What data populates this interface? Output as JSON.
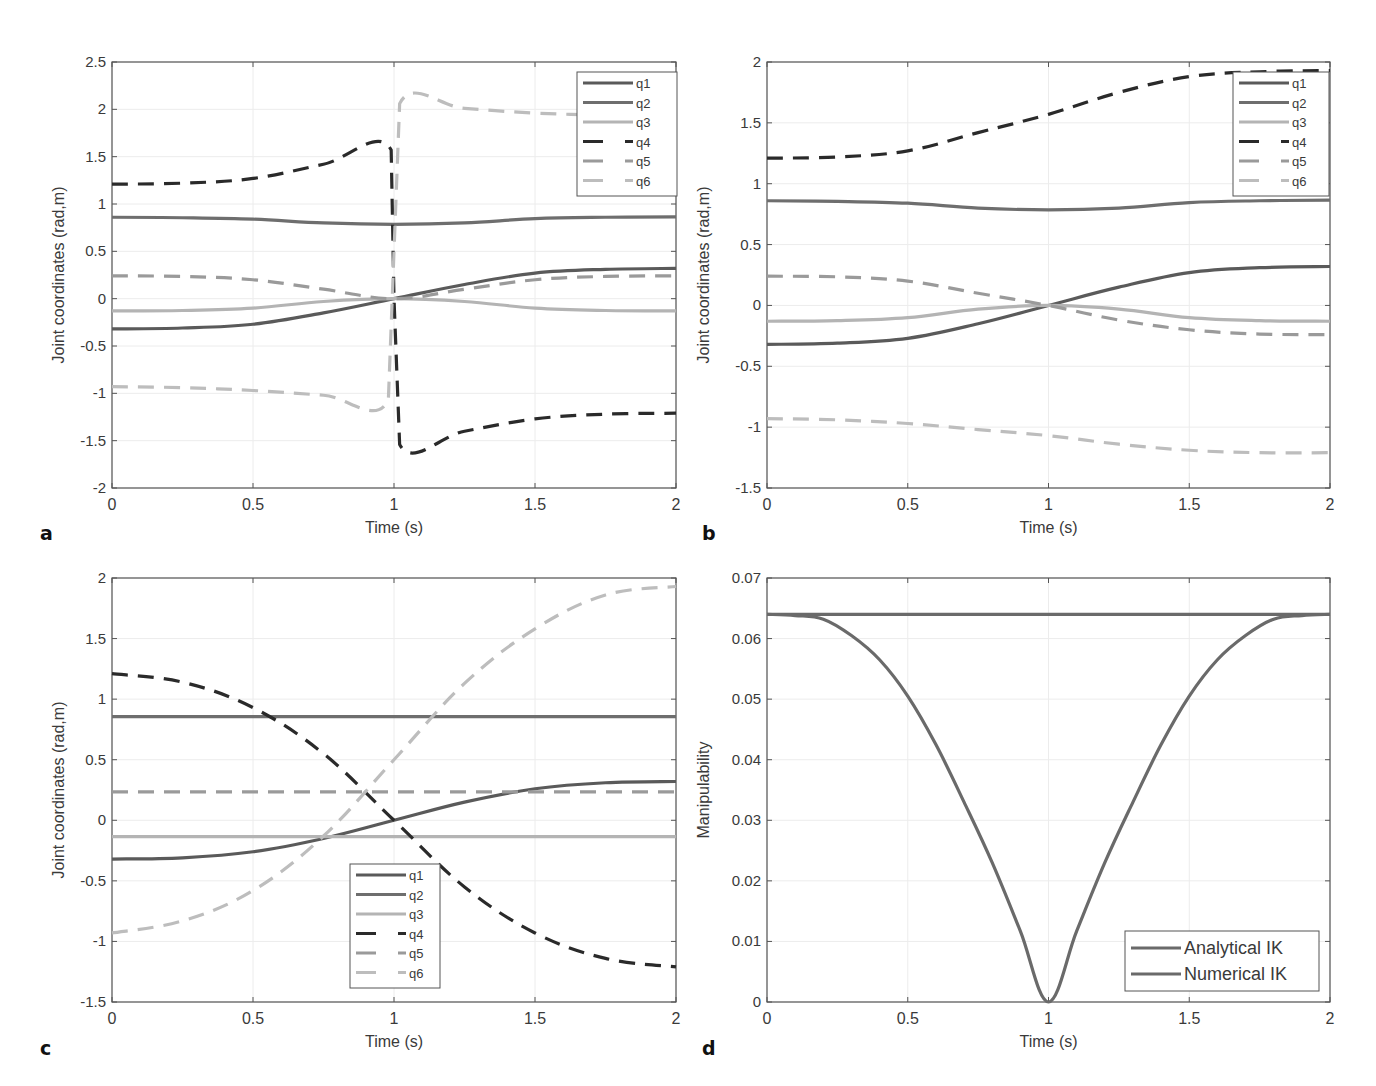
{
  "figure": {
    "panel_letters": [
      "a",
      "b",
      "c",
      "d"
    ]
  },
  "colors": {
    "q1": "#5a5a5a",
    "q2": "#6e6e6e",
    "q3": "#b4b4b4",
    "q4": "#2a2a2a",
    "q5": "#9a9a9a",
    "q6": "#bdbdbd",
    "analytical": "#6a6a6a",
    "numerical": "#6a6a6a",
    "axis": "#555555",
    "grid": "#ececec"
  },
  "chart_data": [
    {
      "id": "a",
      "type": "line",
      "title": "",
      "xlabel": "Time (s)",
      "ylabel": "Joint coordinates (rad,m)",
      "xlim": [
        0,
        2
      ],
      "ylim": [
        -2,
        2.5
      ],
      "xticks": [
        0,
        0.5,
        1,
        1.5,
        2
      ],
      "xtick_labels": [
        "0",
        "0.5",
        "1",
        "1.5",
        "2"
      ],
      "yticks": [
        -2,
        -1.5,
        -1,
        -0.5,
        0,
        0.5,
        1,
        1.5,
        2,
        2.5
      ],
      "ytick_labels": [
        "-2",
        "-1.5",
        "-1",
        "-0.5",
        "0",
        "0.5",
        "1",
        "1.5",
        "2",
        "2.5"
      ],
      "grid": true,
      "legend_position": "northeast",
      "legend": [
        "q1",
        "q2",
        "q3",
        "q4",
        "q5",
        "q6"
      ],
      "series": [
        {
          "name": "q1",
          "style": "solid",
          "x": [
            0,
            0.25,
            0.5,
            0.75,
            1.0,
            1.25,
            1.5,
            1.75,
            2.0
          ],
          "values": [
            -0.32,
            -0.31,
            -0.27,
            -0.15,
            0.0,
            0.15,
            0.27,
            0.31,
            0.32
          ]
        },
        {
          "name": "q2",
          "style": "solid",
          "x": [
            0,
            0.25,
            0.5,
            0.75,
            1.0,
            1.25,
            1.5,
            1.75,
            2.0
          ],
          "values": [
            0.86,
            0.855,
            0.84,
            0.8,
            0.785,
            0.8,
            0.845,
            0.86,
            0.865
          ]
        },
        {
          "name": "q3",
          "style": "solid",
          "x": [
            0,
            0.25,
            0.5,
            0.75,
            1.0,
            1.25,
            1.5,
            1.75,
            2.0
          ],
          "values": [
            -0.13,
            -0.125,
            -0.1,
            -0.03,
            0.0,
            -0.03,
            -0.1,
            -0.125,
            -0.13
          ]
        },
        {
          "name": "q4",
          "style": "dashed",
          "x": [
            0,
            0.25,
            0.5,
            0.75,
            0.99,
            1.0,
            1.02,
            1.25,
            1.5,
            1.75,
            2.0
          ],
          "values": [
            1.21,
            1.22,
            1.27,
            1.42,
            1.57,
            0.0,
            -1.54,
            -1.4,
            -1.27,
            -1.22,
            -1.21
          ]
        },
        {
          "name": "q5",
          "style": "dashed",
          "x": [
            0,
            0.25,
            0.5,
            0.75,
            1.0,
            1.25,
            1.5,
            1.75,
            2.0
          ],
          "values": [
            0.24,
            0.235,
            0.2,
            0.1,
            0.0,
            0.1,
            0.2,
            0.235,
            0.24
          ]
        },
        {
          "name": "q6",
          "style": "dashed",
          "x": [
            0,
            0.25,
            0.5,
            0.75,
            0.98,
            1.0,
            1.02,
            1.25,
            1.5,
            1.75,
            2.0
          ],
          "values": [
            -0.93,
            -0.94,
            -0.97,
            -1.02,
            -1.07,
            0.5,
            2.06,
            2.01,
            1.96,
            1.94,
            1.93
          ]
        }
      ]
    },
    {
      "id": "b",
      "type": "line",
      "title": "",
      "xlabel": "Time (s)",
      "ylabel": "Joint coordinates (rad,m)",
      "xlim": [
        0,
        2
      ],
      "ylim": [
        -1.5,
        2
      ],
      "xticks": [
        0,
        0.5,
        1,
        1.5,
        2
      ],
      "xtick_labels": [
        "0",
        "0.5",
        "1",
        "1.5",
        "2"
      ],
      "yticks": [
        -1.5,
        -1,
        -0.5,
        0,
        0.5,
        1,
        1.5,
        2
      ],
      "ytick_labels": [
        "-1.5",
        "-1",
        "-0.5",
        "0",
        "0.5",
        "1",
        "1.5",
        "2"
      ],
      "grid": true,
      "legend_position": "northeast",
      "legend": [
        "q1",
        "q2",
        "q3",
        "q4",
        "q5",
        "q6"
      ],
      "series": [
        {
          "name": "q1",
          "style": "solid",
          "x": [
            0,
            0.25,
            0.5,
            0.75,
            1.0,
            1.25,
            1.5,
            1.75,
            2.0
          ],
          "values": [
            -0.32,
            -0.31,
            -0.27,
            -0.15,
            0.0,
            0.15,
            0.27,
            0.31,
            0.32
          ]
        },
        {
          "name": "q2",
          "style": "solid",
          "x": [
            0,
            0.25,
            0.5,
            0.75,
            1.0,
            1.25,
            1.5,
            1.75,
            2.0
          ],
          "values": [
            0.86,
            0.855,
            0.84,
            0.8,
            0.785,
            0.8,
            0.845,
            0.86,
            0.865
          ]
        },
        {
          "name": "q3",
          "style": "solid",
          "x": [
            0,
            0.25,
            0.5,
            0.75,
            1.0,
            1.25,
            1.5,
            1.75,
            2.0
          ],
          "values": [
            -0.13,
            -0.125,
            -0.1,
            -0.03,
            0.0,
            -0.03,
            -0.1,
            -0.125,
            -0.13
          ]
        },
        {
          "name": "q4",
          "style": "dashed",
          "x": [
            0,
            0.25,
            0.5,
            0.75,
            1.0,
            1.25,
            1.5,
            1.75,
            2.0
          ],
          "values": [
            1.21,
            1.22,
            1.27,
            1.42,
            1.57,
            1.75,
            1.88,
            1.92,
            1.93
          ]
        },
        {
          "name": "q5",
          "style": "dashed",
          "x": [
            0,
            0.25,
            0.5,
            0.75,
            1.0,
            1.25,
            1.5,
            1.75,
            2.0
          ],
          "values": [
            0.24,
            0.235,
            0.2,
            0.1,
            0.0,
            -0.12,
            -0.2,
            -0.235,
            -0.24
          ]
        },
        {
          "name": "q6",
          "style": "dashed",
          "x": [
            0,
            0.25,
            0.5,
            0.75,
            1.0,
            1.25,
            1.5,
            1.75,
            2.0
          ],
          "values": [
            -0.93,
            -0.94,
            -0.97,
            -1.02,
            -1.07,
            -1.14,
            -1.19,
            -1.21,
            -1.21
          ]
        }
      ]
    },
    {
      "id": "c",
      "type": "line",
      "title": "",
      "xlabel": "Time (s)",
      "ylabel": "Joint coordinates (rad,m)",
      "xlim": [
        0,
        2
      ],
      "ylim": [
        -1.5,
        2
      ],
      "xticks": [
        0,
        0.5,
        1,
        1.5,
        2
      ],
      "xtick_labels": [
        "0",
        "0.5",
        "1",
        "1.5",
        "2"
      ],
      "yticks": [
        -1.5,
        -1,
        -0.5,
        0,
        0.5,
        1,
        1.5,
        2
      ],
      "ytick_labels": [
        "-1.5",
        "-1",
        "-0.5",
        "0",
        "0.5",
        "1",
        "1.5",
        "2"
      ],
      "grid": true,
      "legend_position": "south",
      "legend": [
        "q1",
        "q2",
        "q3",
        "q4",
        "q5",
        "q6"
      ],
      "series": [
        {
          "name": "q1",
          "style": "solid",
          "x": [
            0,
            0.25,
            0.5,
            0.75,
            1.0,
            1.25,
            1.5,
            1.75,
            2.0
          ],
          "values": [
            -0.32,
            -0.31,
            -0.26,
            -0.15,
            0.0,
            0.15,
            0.26,
            0.31,
            0.32
          ]
        },
        {
          "name": "q2",
          "style": "solid",
          "x": [
            0,
            2.0
          ],
          "values": [
            0.855,
            0.855
          ]
        },
        {
          "name": "q3",
          "style": "solid",
          "x": [
            0,
            2.0
          ],
          "values": [
            -0.135,
            -0.135
          ]
        },
        {
          "name": "q4",
          "style": "dashed",
          "x": [
            0,
            0.25,
            0.5,
            0.75,
            1.0,
            1.25,
            1.5,
            1.75,
            2.0
          ],
          "values": [
            1.21,
            1.14,
            0.93,
            0.55,
            0.0,
            -0.55,
            -0.93,
            -1.14,
            -1.21
          ]
        },
        {
          "name": "q5",
          "style": "dashed",
          "x": [
            0,
            2.0
          ],
          "values": [
            0.235,
            0.235
          ]
        },
        {
          "name": "q6",
          "style": "dashed",
          "x": [
            0,
            0.25,
            0.5,
            0.75,
            1.0,
            1.25,
            1.5,
            1.75,
            2.0
          ],
          "values": [
            -0.93,
            -0.83,
            -0.58,
            -0.13,
            0.5,
            1.13,
            1.58,
            1.86,
            1.93
          ]
        }
      ]
    },
    {
      "id": "d",
      "type": "line",
      "title": "",
      "xlabel": "Time (s)",
      "ylabel": "Manipulability",
      "xlim": [
        0,
        2
      ],
      "ylim": [
        0,
        0.07
      ],
      "xticks": [
        0,
        0.5,
        1,
        1.5,
        2
      ],
      "xtick_labels": [
        "0",
        "0.5",
        "1",
        "1.5",
        "2"
      ],
      "yticks": [
        0,
        0.01,
        0.02,
        0.03,
        0.04,
        0.05,
        0.06,
        0.07
      ],
      "ytick_labels": [
        "0",
        "0.01",
        "0.02",
        "0.03",
        "0.04",
        "0.05",
        "0.06",
        "0.07"
      ],
      "grid": true,
      "legend_position": "southeast",
      "legend": [
        "Analytical IK",
        "Numerical IK"
      ],
      "series": [
        {
          "name": "Analytical IK",
          "style": "solid",
          "x": [
            0,
            2.0
          ],
          "values": [
            0.064,
            0.064
          ]
        },
        {
          "name": "Numerical IK",
          "style": "solid",
          "x": [
            0,
            0.1,
            0.2,
            0.3,
            0.4,
            0.5,
            0.6,
            0.7,
            0.8,
            0.9,
            1.0,
            1.1,
            1.2,
            1.3,
            1.4,
            1.5,
            1.6,
            1.7,
            1.8,
            1.9,
            2.0
          ],
          "values": [
            0.064,
            0.0638,
            0.0632,
            0.0605,
            0.0565,
            0.0505,
            0.0425,
            0.033,
            0.023,
            0.0117,
            0.0,
            0.0117,
            0.023,
            0.033,
            0.0425,
            0.0505,
            0.0565,
            0.0605,
            0.0632,
            0.0638,
            0.064
          ]
        }
      ]
    }
  ]
}
